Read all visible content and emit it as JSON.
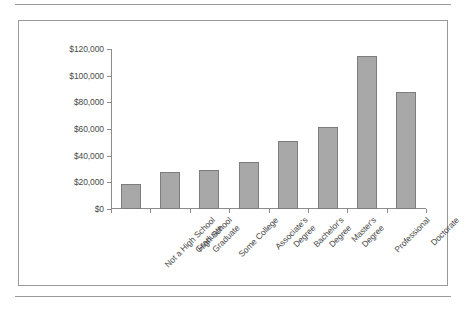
{
  "page": {
    "rule_color": "#9a9a9a",
    "frame_color": "#9a9a9a"
  },
  "chart_data": {
    "type": "bar",
    "title": "",
    "subtitle": "",
    "xlabel": "",
    "ylabel": "",
    "ylim": [
      0,
      120000
    ],
    "ytick_values": [
      0,
      20000,
      40000,
      60000,
      80000,
      100000,
      120000
    ],
    "ytick_labels": [
      "$0",
      "$20,000",
      "$40,000",
      "$60,000",
      "$80,000",
      "$100,000",
      "$120,000"
    ],
    "grid": false,
    "legend": "none",
    "bar_color": "#a8a8a8",
    "bar_border_color": "#7d7d7d",
    "axis_color": "#8c8c8c",
    "categories": [
      "Not a High School Graduate",
      "High School Graduate",
      "Some College",
      "Associate's Degree",
      "Bachelor's Degree",
      "Master's Degree",
      "Professional",
      "Doctorate"
    ],
    "category_lines": [
      [
        "Not a High School",
        "Graduate"
      ],
      [
        "High School",
        "Graduate"
      ],
      [
        "Some College",
        ""
      ],
      [
        "Associate's",
        "Degree"
      ],
      [
        "Bachelor's",
        "Degree"
      ],
      [
        "Master's",
        "Degree"
      ],
      [
        "Professional",
        ""
      ],
      [
        "Doctorate",
        ""
      ]
    ],
    "values": [
      19000,
      28000,
      29500,
      35000,
      51000,
      61500,
      115000,
      88000
    ]
  }
}
